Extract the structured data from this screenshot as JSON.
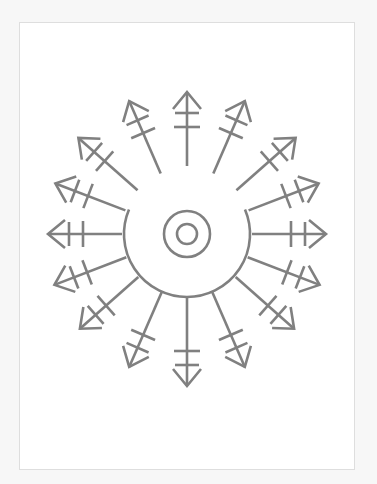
{
  "diagram": {
    "title": "",
    "colors": {
      "stroke": "#808080",
      "page": "#ffffff",
      "page_border": "#dedede",
      "background": "#f7f7f7"
    },
    "stroke_width": 2.6,
    "center": {
      "x": 187,
      "y": 234
    },
    "inner_circle_radius": 10,
    "middle_circle_radius": 23,
    "outer_arc": {
      "radius": 63,
      "start_angle_deg": 157,
      "end_angle_deg": 23
    },
    "arrows": [
      {
        "id": "n",
        "angle": 90,
        "r_start": 68,
        "r_tip": 142
      },
      {
        "id": "nne",
        "angle": 66.5,
        "r_start": 66,
        "r_tip": 145
      },
      {
        "id": "ne",
        "angle": 41.5,
        "r_start": 66,
        "r_tip": 145
      },
      {
        "id": "ene",
        "angle": 21,
        "r_start": 66,
        "r_tip": 141
      },
      {
        "id": "e",
        "angle": 0,
        "r_start": 65,
        "r_tip": 139
      },
      {
        "id": "ese",
        "angle": -21,
        "r_start": 65,
        "r_tip": 142
      },
      {
        "id": "se",
        "angle": -41.5,
        "r_start": 65,
        "r_tip": 143
      },
      {
        "id": "sse",
        "angle": -66.5,
        "r_start": 63,
        "r_tip": 145
      },
      {
        "id": "s",
        "angle": -90,
        "r_start": 63,
        "r_tip": 152
      },
      {
        "id": "ssw",
        "angle": -113.5,
        "r_start": 63,
        "r_tip": 145
      },
      {
        "id": "sw",
        "angle": -138.5,
        "r_start": 65,
        "r_tip": 143
      },
      {
        "id": "wsw",
        "angle": -159,
        "r_start": 65,
        "r_tip": 142
      },
      {
        "id": "w",
        "angle": 180,
        "r_start": 65,
        "r_tip": 139
      },
      {
        "id": "wnw",
        "angle": 159,
        "r_start": 66,
        "r_tip": 141
      },
      {
        "id": "nw",
        "angle": 138.5,
        "r_start": 66,
        "r_tip": 145
      },
      {
        "id": "nnw",
        "angle": 113.5,
        "r_start": 66,
        "r_tip": 145
      }
    ],
    "arrowhead": {
      "length": 17,
      "half_width": 14
    },
    "crossbars": [
      {
        "offset_from_tip": 21,
        "half_width": 12
      },
      {
        "offset_from_tip": 35,
        "half_width": 13
      }
    ]
  }
}
